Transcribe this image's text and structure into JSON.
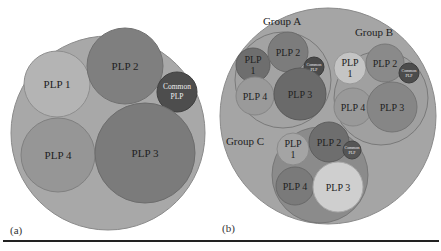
{
  "colors": {
    "outer": "#a6a6a6",
    "outer_stroke": "#8a8a8a",
    "plp1": "#bdbdbd",
    "plp2": "#7e7e7e",
    "plp3": "#7a7a7a",
    "plp4": "#9a9a9a",
    "common": "#4a4a4a",
    "group_fill": "#a0a0a0",
    "group_c_fill": "#8c8c8c"
  },
  "panel_a": {
    "caption": "(a)",
    "circles": [
      {
        "id": "outer",
        "label": "",
        "cx": 108,
        "cy": 133,
        "r": 97
      },
      {
        "id": "plp1",
        "label": "PLP 1",
        "cx": 57,
        "cy": 84,
        "r": 33
      },
      {
        "id": "plp2",
        "label": "PLP 2",
        "cx": 125,
        "cy": 66,
        "r": 38
      },
      {
        "id": "common",
        "label_line1": "Common",
        "label_line2": "PLP",
        "cx": 177,
        "cy": 92,
        "r": 20
      },
      {
        "id": "plp4",
        "label": "PLP 4",
        "cx": 58,
        "cy": 155,
        "r": 37
      },
      {
        "id": "plp3",
        "label": "PLP 3",
        "cx": 145,
        "cy": 153,
        "r": 50
      }
    ]
  },
  "panel_b": {
    "caption": "(b)",
    "outer": {
      "cx": 328,
      "cy": 116,
      "r": 108
    },
    "groups": [
      {
        "name": "Group A",
        "label_x": 282,
        "label_y": 25,
        "cx": 283,
        "cy": 80,
        "r": 48,
        "plp1": {
          "label_line1": "PLP",
          "label_line2": "1",
          "cx": 253,
          "cy": 65,
          "r": 17
        },
        "plp2": {
          "label": "PLP 2",
          "cx": 288,
          "cy": 52,
          "r": 20
        },
        "common": {
          "label_line1": "Common",
          "label_line2": "PLP",
          "cx": 314,
          "cy": 67,
          "r": 10
        },
        "plp4": {
          "label": "PLP 4",
          "cx": 255,
          "cy": 96,
          "r": 19
        },
        "plp3": {
          "label": "PLP 3",
          "cx": 300,
          "cy": 94,
          "r": 26
        }
      },
      {
        "name": "Group B",
        "label_x": 374,
        "label_y": 36,
        "cx": 381,
        "cy": 98,
        "r": 47
      },
      {
        "name": "Group C",
        "label_x": 242,
        "label_y": 141,
        "cx": 320,
        "cy": 175,
        "r": 48
      }
    ],
    "group_b_items": {
      "plp1": {
        "label_line1": "PLP",
        "label_line2": "1",
        "cx": 350,
        "cy": 68,
        "r": 16
      },
      "plp2": {
        "label": "PLP 2",
        "cx": 385,
        "cy": 63,
        "r": 19
      },
      "common": {
        "label_line1": "Common",
        "label_line2": "PLP",
        "cx": 409,
        "cy": 73,
        "r": 10
      },
      "plp4": {
        "label": "PLP 4",
        "cx": 353,
        "cy": 107,
        "r": 19
      },
      "plp3": {
        "label": "PLP 3",
        "cx": 392,
        "cy": 107,
        "r": 25
      }
    },
    "group_c_items": {
      "plp1": {
        "label_line1": "PLP",
        "label_line2": "1",
        "cx": 293,
        "cy": 149,
        "r": 16
      },
      "plp2": {
        "label": "PLP 2",
        "cx": 329,
        "cy": 142,
        "r": 20
      },
      "common": {
        "label_line1": "Common",
        "label_line2": "PLP",
        "cx": 352,
        "cy": 150,
        "r": 9
      },
      "plp4": {
        "label": "PLP 4",
        "cx": 295,
        "cy": 186,
        "r": 19
      },
      "plp3": {
        "label": "PLP 3",
        "cx": 338,
        "cy": 187,
        "r": 25
      }
    }
  }
}
